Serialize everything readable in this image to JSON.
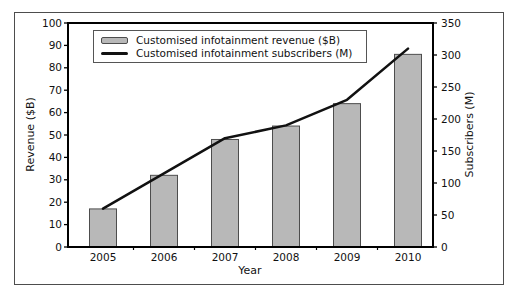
{
  "figure": {
    "background": "#ffffff",
    "border_color": "#4d4d4d",
    "spine_color": "#000000",
    "text_color": "#111111"
  },
  "chart_data": {
    "type": "bar",
    "categories": [
      "2005",
      "2006",
      "2007",
      "2008",
      "2009",
      "2010"
    ],
    "series": [
      {
        "name": "Customised infotainment revenue ($B)",
        "kind": "bar",
        "axis": "left",
        "values": [
          17,
          32,
          48,
          54,
          64,
          86
        ],
        "fill": "#b8b8b8",
        "stroke": "#4d4d4d"
      },
      {
        "name": "Customised infotainment subscribers (M)",
        "kind": "line",
        "axis": "right",
        "values": [
          60,
          115,
          170,
          190,
          230,
          310
        ],
        "color": "#111111"
      }
    ],
    "xlabel": "Year",
    "ylabel_left": "Revenue ($B)",
    "ylabel_right": "Subscribers (M)",
    "ylim_left": [
      0,
      100
    ],
    "ytick_step_left": 10,
    "ylim_right": [
      0,
      350
    ],
    "ytick_step_right": 50,
    "grid": false,
    "legend_position": "top-left"
  }
}
